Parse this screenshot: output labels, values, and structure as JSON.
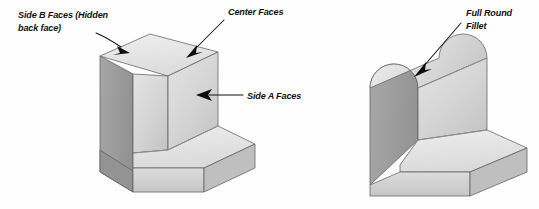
{
  "figure": {
    "background_color": "#fefefe"
  },
  "palette": {
    "top_face": "#e9e9e9",
    "front_face": "#d9d9d9",
    "side_face": "#9d9d9d",
    "inner_face": "#c9c9c9",
    "base_top_face": "#e2e2e2",
    "base_front_face": "#d2d2d2",
    "edge_line": "#5f5f5f",
    "leader_line": "#111111",
    "text_color": "#121212"
  },
  "left_part": {
    "name": "Square edge L-bracket",
    "callouts": [
      {
        "id": "side-b-faces",
        "line1": "Side B Faces (Hidden",
        "line2": "back face)",
        "text_x": 18,
        "text_y": 18,
        "line2_y": 31,
        "leader": "M 96 33 C 106 37, 112 41, 122 47",
        "arrow_tip_x": 130,
        "arrow_tip_y": 53,
        "arrow_angle": 38
      },
      {
        "id": "center-faces",
        "line1": "Center Faces",
        "line2": "",
        "text_x": 228,
        "text_y": 15,
        "line2_y": 28,
        "leader": "M 224 20 L 192 52",
        "arrow_tip_x": 186,
        "arrow_tip_y": 58,
        "arrow_angle": 135
      },
      {
        "id": "side-a-faces",
        "line1": "Side A Faces",
        "line2": "",
        "text_x": 247,
        "text_y": 99,
        "line2_y": 112,
        "leader": "M 243 95 L 208 95",
        "arrow_tip_x": 196,
        "arrow_tip_y": 95,
        "arrow_angle": 180
      }
    ]
  },
  "right_part": {
    "name": "Full round fillet L-bracket",
    "callouts": [
      {
        "id": "full-round-fillet",
        "line1": "Full Round",
        "line2": "Fillet",
        "text_x": 466,
        "text_y": 16,
        "line2_y": 29,
        "leader": "M 461 23 L 421 69",
        "arrow_tip_x": 414,
        "arrow_tip_y": 77,
        "arrow_angle": 131
      }
    ]
  },
  "labels_flat": [
    "Side B Faces (Hidden",
    "back face)",
    "Center Faces",
    "Side A Faces",
    "Full Round",
    "Fillet"
  ]
}
